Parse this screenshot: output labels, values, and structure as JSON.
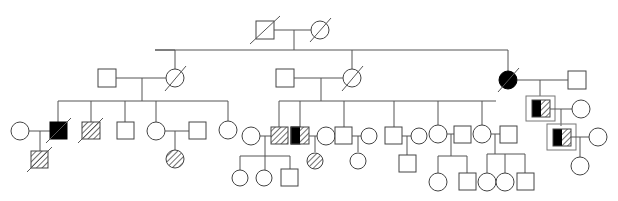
{
  "diagram": {
    "type": "pedigree",
    "legend": {
      "square": "male",
      "circle": "female",
      "slash": "deceased",
      "filled": "affected",
      "hatched": "partially affected / carrier",
      "half-filled-half-hatched": "mixed phenotype",
      "boxed": "proband / highlighted individual"
    },
    "colors": {
      "line": "#555555",
      "affected": "#000000",
      "background": "#ffffff"
    },
    "generations": [
      {
        "label": "I",
        "individuals": [
          "I-1 male deceased",
          "I-2 female deceased"
        ]
      },
      {
        "label": "II",
        "individuals": [
          "II-left couple: male, female deceased",
          "II-middle couple: male, female deceased",
          "II-right couple: female affected deceased, male"
        ]
      },
      {
        "label": "III",
        "count": 16
      },
      {
        "label": "IV",
        "count": 13
      }
    ]
  }
}
